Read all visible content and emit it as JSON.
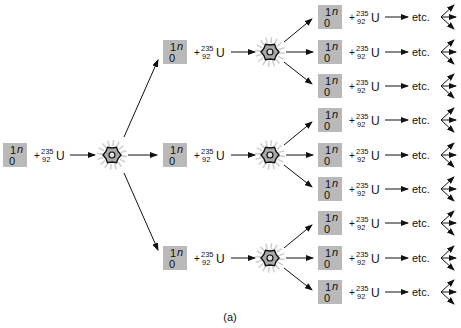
{
  "diagram": {
    "neutron": {
      "mass_number": "1",
      "atomic_number": "0",
      "symbol": "n"
    },
    "uranium": {
      "plus": "+",
      "mass_number": "235",
      "atomic_number": "92",
      "symbol": "U"
    },
    "continuation_label": "etc.",
    "caption": "(a)",
    "generations": [
      {
        "name": "initial",
        "reactions": 1
      },
      {
        "name": "first",
        "reactions": 3
      },
      {
        "name": "second",
        "reactions": 9
      }
    ],
    "neutrons_per_fission": 3,
    "colors": {
      "neutron_box": "#b9b9b9",
      "ink": "#111111",
      "burst_fill": "#a9a9a9",
      "burst_rays": "#cfcfcf"
    }
  }
}
